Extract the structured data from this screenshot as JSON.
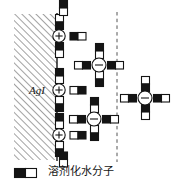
{
  "figure": {
    "title_present": false,
    "solid_phase": {
      "label": "AgI",
      "fill": "hatch-45",
      "color": "#000000"
    },
    "boundary_line": {
      "style": "solid",
      "x": 57,
      "color": "#000000"
    },
    "shear_plane": {
      "style": "dashed",
      "x": 117,
      "color": "#555555"
    },
    "ion_symbols": {
      "cation": "+",
      "anion": "−"
    },
    "colors": {
      "ink": "#000000",
      "hatch": "#7a7a7a",
      "dipole_negative": "#141414",
      "dipole_positive": "#ffffff",
      "dashed": "#555555"
    },
    "cations": [
      {
        "name": "cation-1",
        "cx": 59,
        "cy": 36,
        "charge": "+",
        "waters": [
          "top",
          "bottom",
          "right"
        ]
      },
      {
        "name": "cation-2",
        "cx": 59,
        "cy": 90,
        "charge": "+",
        "waters": [
          "top",
          "bottom",
          "right"
        ]
      },
      {
        "name": "cation-3",
        "cx": 59,
        "cy": 135,
        "charge": "+",
        "waters": [
          "top",
          "bottom",
          "right"
        ]
      }
    ],
    "anions": [
      {
        "name": "anion-1",
        "cx": 99,
        "cy": 65,
        "charge": "−",
        "waters": [
          "top",
          "bottom",
          "left",
          "right"
        ]
      },
      {
        "name": "anion-2",
        "cx": 94,
        "cy": 119,
        "charge": "−",
        "waters": [
          "top",
          "bottom",
          "left",
          "right"
        ]
      },
      {
        "name": "anion-3",
        "cx": 145,
        "cy": 98,
        "charge": "−",
        "waters": [
          "top",
          "bottom",
          "left",
          "right"
        ]
      }
    ],
    "free_waters": [
      {
        "name": "free-water-1",
        "cx": 63,
        "cy": 15,
        "orient": "vertical-black-bottom"
      },
      {
        "name": "free-water-2",
        "cx": 63,
        "cy": 158,
        "orient": "vertical-black-top"
      }
    ]
  },
  "legend": {
    "swatch_name": "solvated-water-dipole-swatch",
    "label": "溶剂化水分子",
    "negative_mark": "−",
    "positive_mark": "+"
  }
}
